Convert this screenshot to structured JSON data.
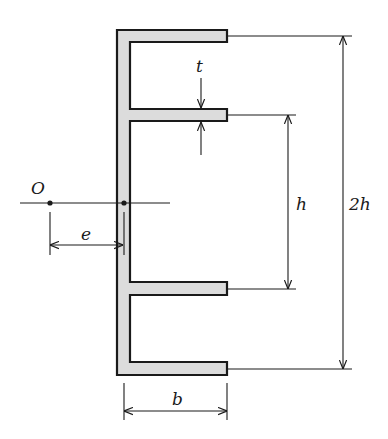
{
  "figure": {
    "colors": {
      "section_fill": "#dcdcdc",
      "stroke": "#1a1a1a",
      "background": "#ffffff"
    }
  },
  "labels": {
    "shear_center": "O",
    "eccentricity": "e",
    "thickness": "t",
    "inner_height": "h",
    "outer_height": "2h",
    "flange_width": "b"
  }
}
